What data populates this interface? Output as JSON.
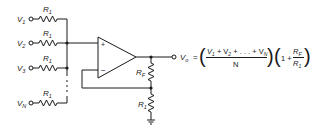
{
  "diagram": {
    "inputs": [
      {
        "label": "V",
        "sub": "1",
        "resistor": "R",
        "resistor_sub": "1"
      },
      {
        "label": "V",
        "sub": "2",
        "resistor": "R",
        "resistor_sub": "1"
      },
      {
        "label": "V",
        "sub": "3",
        "resistor": "R",
        "resistor_sub": "1"
      },
      {
        "label": "V",
        "sub": "N",
        "resistor": "R",
        "resistor_sub": "1"
      }
    ],
    "opamp": {
      "plus_label": "+",
      "minus_label": "−"
    },
    "feedback_resistor": {
      "label": "R",
      "sub": "F"
    },
    "ground_resistor": {
      "label": "R",
      "sub": "1"
    },
    "output": {
      "label": "V",
      "sub": "o",
      "equals": "=",
      "numerator": "V₁ + V₂ + . . . + V_N",
      "numerator_parts": [
        "V",
        "1",
        " + V",
        "2",
        " + . . . + V",
        "N"
      ],
      "denominator": "N",
      "gain_prefix": "1 +",
      "gain_num": {
        "label": "R",
        "sub": "F"
      },
      "gain_den": {
        "label": "R",
        "sub": "1"
      }
    }
  }
}
